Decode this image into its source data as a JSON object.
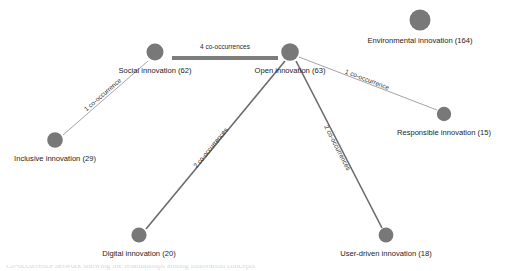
{
  "figure": {
    "background_color": "#ffffff",
    "node_color": "#787878",
    "edge_color": "#6e6e6e"
  },
  "caption": {
    "text": "Co-occurrence network showing the relationships among innovation concepts"
  },
  "chart_data": {
    "type": "network",
    "nodes": [
      {
        "id": "social",
        "label": "Social innovation (62)",
        "name": "Social innovation",
        "count": 62,
        "x": 155,
        "y": 52,
        "r": 8.5,
        "label_x": 155,
        "label_y": 71
      },
      {
        "id": "open",
        "label": "Open innovation (63)",
        "name": "Open innovation",
        "count": 63,
        "x": 290,
        "y": 52,
        "r": 8.8,
        "label_x": 290,
        "label_y": 71
      },
      {
        "id": "environmental",
        "label": "Environmental innovation (164)",
        "name": "Environmental innovation",
        "count": 164,
        "x": 420,
        "y": 20,
        "r": 10.5,
        "label_x": 420,
        "label_y": 41
      },
      {
        "id": "responsible",
        "label": "Responsible innovation (15)",
        "name": "Responsible innovation",
        "count": 15,
        "x": 444,
        "y": 114,
        "r": 7.2,
        "label_x": 444,
        "label_y": 133
      },
      {
        "id": "inclusive",
        "label": "Inclusive innovation (29)",
        "name": "Inclusive innovation",
        "count": 29,
        "x": 55,
        "y": 140,
        "r": 7.8,
        "label_x": 55,
        "label_y": 159
      },
      {
        "id": "digital",
        "label": "Digital innovation (20)",
        "name": "Digital innovation",
        "count": 20,
        "x": 139,
        "y": 235,
        "r": 7.6,
        "label_x": 139,
        "label_y": 254
      },
      {
        "id": "userdriven",
        "label": "User-driven innovation (18)",
        "name": "User-driven innovation",
        "count": 18,
        "x": 386,
        "y": 235,
        "r": 7.4,
        "label_x": 386,
        "label_y": 254
      }
    ],
    "edges": [
      {
        "id": "social-open",
        "source": "social",
        "target": "open",
        "weight": 4,
        "label": "4 co-occurrences",
        "x1": 172,
        "y1": 58,
        "x2": 278,
        "y2": 58,
        "thickness": "thick",
        "label_x": 225,
        "label_y": 47,
        "label_rotation": 0
      },
      {
        "id": "inclusive-social",
        "source": "inclusive",
        "target": "social",
        "weight": 1,
        "label": "1 co-occurrence",
        "x1": 63,
        "y1": 135,
        "x2": 148,
        "y2": 61,
        "thickness": "thin",
        "label_x": 103,
        "label_y": 95,
        "label_rotation": -41
      },
      {
        "id": "open-responsible",
        "source": "open",
        "target": "responsible",
        "weight": 1,
        "label": "1 co-occurrence",
        "x1": 299,
        "y1": 57,
        "x2": 437,
        "y2": 110,
        "thickness": "thin",
        "label_x": 367,
        "label_y": 80,
        "label_rotation": 21
      },
      {
        "id": "open-digital",
        "source": "open",
        "target": "digital",
        "weight": 2,
        "label": "2 co-occurrences",
        "x1": 285,
        "y1": 61,
        "x2": 146,
        "y2": 229,
        "thickness": "medium",
        "label_x": 211,
        "label_y": 148,
        "label_rotation": -50.4
      },
      {
        "id": "open-userdriven",
        "source": "open",
        "target": "userdriven",
        "weight": 2,
        "label": "2 co-occurrences",
        "x1": 296,
        "y1": 61,
        "x2": 382,
        "y2": 228,
        "thickness": "medium",
        "label_x": 337,
        "label_y": 148,
        "label_rotation": 62.8
      }
    ],
    "legend": {
      "visible": false
    },
    "xlabel": "",
    "ylabel": ""
  }
}
